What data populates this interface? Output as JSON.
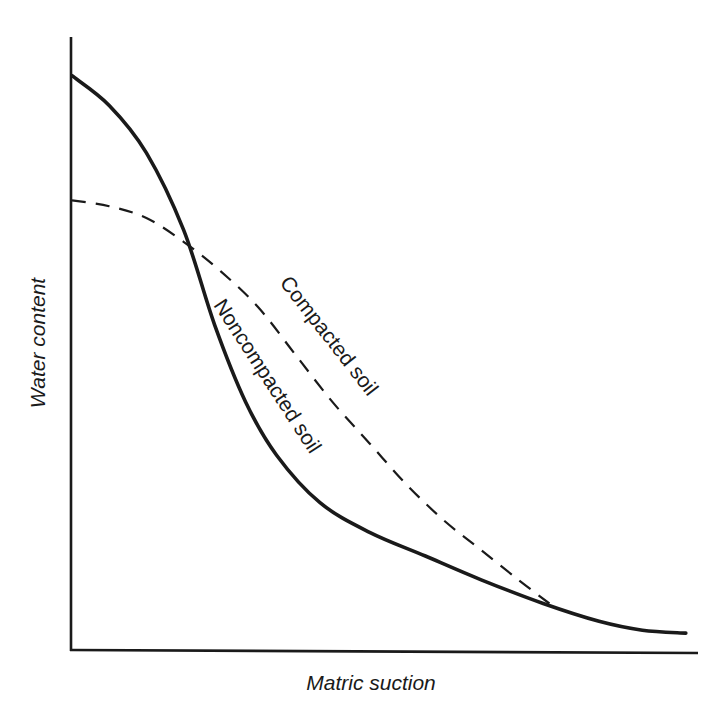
{
  "chart_data": {
    "type": "line",
    "title": "",
    "xlabel": "Matric suction",
    "ylabel": "Water content",
    "xlim": [
      0,
      100
    ],
    "ylim": [
      0,
      100
    ],
    "grid": false,
    "ticks": "none (qualitative axes)",
    "legend": "none (curves labeled inline)",
    "series": [
      {
        "name": "Noncompacted soil",
        "label": "Noncompacted soil",
        "style": "solid",
        "color": "#1a1a1a",
        "x": [
          0,
          6,
          12,
          18,
          23,
          28,
          33,
          40,
          48,
          57,
          66,
          76,
          85,
          92,
          99
        ],
        "y": [
          96,
          91,
          83,
          70,
          54,
          41,
          32,
          24,
          19,
          15,
          11,
          7,
          4,
          2.5,
          2
        ]
      },
      {
        "name": "Compacted soil",
        "label": "Compacted soil",
        "style": "dashed",
        "color": "#1a1a1a",
        "x": [
          0,
          6,
          12,
          18,
          24,
          30,
          36,
          42,
          48,
          54,
          60,
          66,
          72,
          77
        ],
        "y": [
          75,
          74,
          72,
          68,
          63,
          57,
          49,
          41,
          34,
          27,
          21,
          16,
          11,
          7
        ]
      }
    ]
  }
}
